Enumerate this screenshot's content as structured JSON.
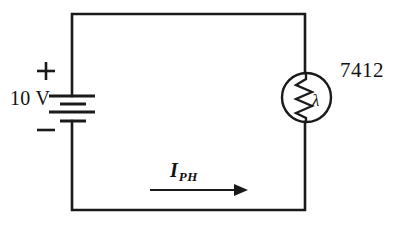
{
  "figure": {
    "name": "photoconductive-cell-circuit",
    "background_color": "#ffffff",
    "line_color": "#1a1a1a"
  },
  "source": {
    "voltage_label": "10 V",
    "polarity_positive": "+",
    "polarity_negative": "−",
    "component": "dc-battery"
  },
  "load": {
    "part_number": "7412",
    "component": "photoconductive-cell",
    "light_symbol": "λ"
  },
  "current": {
    "symbol": "I",
    "subscript": "PH",
    "direction": "right"
  }
}
